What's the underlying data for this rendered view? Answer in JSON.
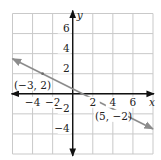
{
  "chart_data": {
    "type": "line",
    "title": "",
    "xlabel": "x",
    "ylabel": "y",
    "xlim": [
      -6,
      8
    ],
    "ylim": [
      -6,
      8
    ],
    "grid": true,
    "grid_step": 2,
    "x_ticks": [
      {
        "value": -4,
        "label": "−4"
      },
      {
        "value": -2,
        "label": "−2"
      },
      {
        "value": 2,
        "label": "2"
      },
      {
        "value": 4,
        "label": "4"
      },
      {
        "value": 6,
        "label": "6"
      }
    ],
    "y_ticks": [
      {
        "value": 6,
        "label": "6"
      },
      {
        "value": 4,
        "label": "4"
      },
      {
        "value": 2,
        "label": "2"
      },
      {
        "value": -2,
        "label": "−2"
      },
      {
        "value": -4,
        "label": "−4"
      }
    ],
    "series": [
      {
        "name": "line through (-3, 2) and (5, -2)",
        "equation": "y = -0.5x + 0.5",
        "slope": -0.5,
        "intercept": 0.5,
        "x": [
          -6,
          8
        ],
        "y": [
          3.5,
          -3.5
        ],
        "arrows": "both",
        "color": "#8c8c8c"
      }
    ],
    "points": [
      {
        "x": -3,
        "y": 2,
        "label": "(−3, 2)"
      },
      {
        "x": 5,
        "y": -2,
        "label": "(5, −2)"
      }
    ]
  },
  "colors": {
    "grid": "#c9c9c9",
    "axis": "#111111",
    "line": "#8c8c8c",
    "point": "#6e6e6e",
    "text": "#222222"
  }
}
